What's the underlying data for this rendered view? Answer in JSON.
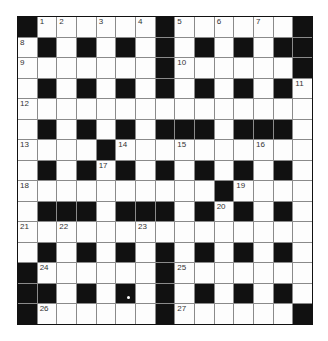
{
  "puzzle": {
    "type": "crossword",
    "rows": 15,
    "cols": 15,
    "layout": [
      "#######.#######",
      "",
      "",
      "",
      "",
      "",
      "",
      "",
      "",
      "",
      "",
      "",
      "",
      "",
      ""
    ],
    "pattern": [
      "#......#......#",
      ".#.#.#.#.#.#.##",
      ".......#......#",
      ".#.#.#.#.#.#.#.",
      "...............",
      ".#.#.#.###.###.",
      "....#..........",
      ".#.#.#.#.#.#.#.",
      "..........#....",
      ".###.###.#.#.#.",
      "...............",
      ".#.#.#.#.#.#.#.",
      "#......#.......",
      "##.#.#.#.#.#.#.",
      "#......#......#"
    ],
    "numbers": [
      {
        "n": "1",
        "r": 0,
        "c": 1
      },
      {
        "n": "2",
        "r": 0,
        "c": 2
      },
      {
        "n": "3",
        "r": 0,
        "c": 4
      },
      {
        "n": "4",
        "r": 0,
        "c": 6
      },
      {
        "n": "5",
        "r": 0,
        "c": 8
      },
      {
        "n": "6",
        "r": 0,
        "c": 10
      },
      {
        "n": "7",
        "r": 0,
        "c": 12
      },
      {
        "n": "8",
        "r": 1,
        "c": 0
      },
      {
        "n": "9",
        "r": 2,
        "c": 0
      },
      {
        "n": "10",
        "r": 2,
        "c": 8
      },
      {
        "n": "11",
        "r": 3,
        "c": 14
      },
      {
        "n": "12",
        "r": 4,
        "c": 0
      },
      {
        "n": "13",
        "r": 6,
        "c": 0
      },
      {
        "n": "14",
        "r": 6,
        "c": 5
      },
      {
        "n": "15",
        "r": 6,
        "c": 8
      },
      {
        "n": "16",
        "r": 6,
        "c": 12
      },
      {
        "n": "17",
        "r": 7,
        "c": 4
      },
      {
        "n": "18",
        "r": 8,
        "c": 0
      },
      {
        "n": "19",
        "r": 8,
        "c": 11
      },
      {
        "n": "20",
        "r": 9,
        "c": 10
      },
      {
        "n": "21",
        "r": 10,
        "c": 0
      },
      {
        "n": "22",
        "r": 10,
        "c": 2
      },
      {
        "n": "23",
        "r": 10,
        "c": 6
      },
      {
        "n": "24",
        "r": 12,
        "c": 1
      },
      {
        "n": "25",
        "r": 12,
        "c": 8
      },
      {
        "n": "26",
        "r": 14,
        "c": 1
      },
      {
        "n": "27",
        "r": 14,
        "c": 8
      }
    ],
    "colors": {
      "block": "#111111",
      "cell": "#fdfdfd",
      "gridline": "#8a8a8a",
      "number": "#333333"
    }
  }
}
